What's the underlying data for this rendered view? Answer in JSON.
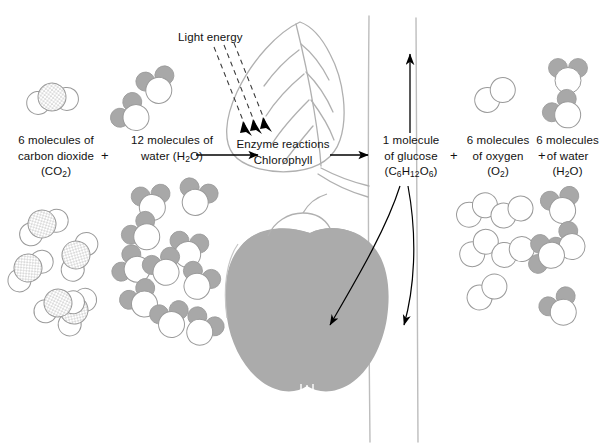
{
  "diagram": {
    "background": "#ffffff",
    "colors": {
      "molecule_outline": "#9a9a9a",
      "molecule_gray_fill": "#a8a8a8",
      "stipple_fill": "#c9c9c9",
      "apple_fill": "#ababab",
      "plant_outline": "#b0b0b0",
      "arrow_black": "#000000",
      "text": "#111111"
    }
  },
  "labels": {
    "light_energy": "Light energy",
    "enzyme_reactions": "Enzyme reactions",
    "chlorophyll": "Chlorophyll",
    "plus_1": "+",
    "plus_2": "+",
    "plus_3": "+"
  },
  "reactants": [
    {
      "id": "carbon-dioxide",
      "line1": "6 molecules of",
      "line2": "carbon dioxide",
      "formula_prefix": "(CO",
      "formula_sub": "2",
      "formula_suffix": ")",
      "molecule_type": "co2",
      "count_drawn": 6
    },
    {
      "id": "water-left",
      "line1": "12 molecules of",
      "line2_prefix": "water (H",
      "line2_sub": "2",
      "line2_suffix": "O)",
      "molecule_type": "h2o",
      "count_drawn": 12
    }
  ],
  "products": [
    {
      "id": "glucose",
      "line1": "1 molecule",
      "line2": "of glucose",
      "formula": "(C6H12O6)",
      "formula_parts": [
        "(C",
        "6",
        "H",
        "12",
        "O",
        "6",
        ")"
      ]
    },
    {
      "id": "oxygen",
      "line1": "6 molecules",
      "line2": "of oxygen",
      "formula_prefix": "(O",
      "formula_sub": "2",
      "formula_suffix": ")",
      "molecule_type": "o2",
      "count_drawn": 6
    },
    {
      "id": "water-right",
      "line1": "6 molecules",
      "line2": "of water",
      "formula_prefix": "(H",
      "formula_sub": "2",
      "formula_suffix": "O)",
      "molecule_type": "h2o",
      "count_drawn": 6
    }
  ],
  "plant": {
    "leaf": "leaf-outline-with-veins",
    "fruit": "apple-silhouette",
    "stem_lines": 3
  },
  "arrows": {
    "light_rays": 3,
    "reaction_arrow_left": "arrow-right",
    "reaction_arrow_right": "arrow-right",
    "glucose_up_arrow": "arrow-up",
    "glucose_curve_into_fruit": "curved-arrow-down-left",
    "glucose_curve_right": "curved-arrow-down"
  }
}
